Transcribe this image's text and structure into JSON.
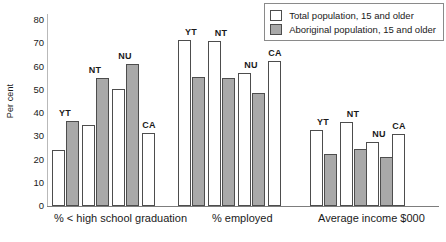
{
  "chart_data": {
    "type": "bar",
    "title": "",
    "subtitle": "",
    "xlabel": "",
    "ylabel": "Per cent",
    "ylim": [
      0,
      80
    ],
    "yticks": [
      0,
      10,
      20,
      30,
      40,
      50,
      60,
      70,
      80
    ],
    "grid": false,
    "legend_position": "top-right",
    "legend": [
      {
        "name": "Total population, 15 and older",
        "color": "#ffffff"
      },
      {
        "name": "Aboriginal population, 15 and older",
        "color": "#a9a9a9"
      }
    ],
    "series": [
      {
        "name": "Total population, 15 and older",
        "color": "#ffffff"
      },
      {
        "name": "Aboriginal population, 15 and older",
        "color": "#a9a9a9"
      }
    ],
    "groups": [
      {
        "label": "% < high school graduation",
        "categories": [
          "YT",
          "NT",
          "NU",
          "CA"
        ],
        "values": {
          "Total population, 15 and older": [
            24,
            35,
            50.5,
            31.5
          ],
          "Aboriginal population, 15 and older": [
            36.5,
            55,
            61,
            null
          ]
        }
      },
      {
        "label": "% employed",
        "categories": [
          "YT",
          "NT",
          "NU",
          "CA"
        ],
        "values": {
          "Total population, 15 and older": [
            71.5,
            71,
            57,
            62.5
          ],
          "Aboriginal population, 15 and older": [
            55.5,
            55,
            48.5,
            null
          ]
        }
      },
      {
        "label": "Average income $000",
        "categories": [
          "YT",
          "NT",
          "NU",
          "CA"
        ],
        "values": {
          "Total population, 15 and older": [
            32.5,
            36,
            27.5,
            31
          ],
          "Aboriginal population, 15 and older": [
            22.5,
            24.5,
            21,
            null
          ]
        }
      }
    ]
  },
  "axis": {
    "y_title": "Per cent",
    "y_ticks": [
      "80",
      "70",
      "60",
      "50",
      "40",
      "30",
      "20",
      "10",
      "0"
    ]
  },
  "legend": {
    "items": [
      {
        "label": "Total population, 15 and older",
        "swatch": "total"
      },
      {
        "label": "Aboriginal population, 15 and older",
        "swatch": "aboriginal"
      }
    ]
  },
  "groups": [
    {
      "caption": "% < high school graduation"
    },
    {
      "caption": "% employed"
    },
    {
      "caption": "Average income $000"
    }
  ]
}
